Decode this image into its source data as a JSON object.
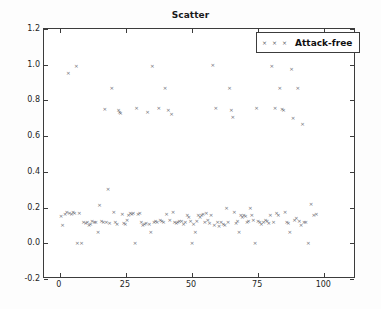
{
  "figure": {
    "title": "Scatter",
    "background_color": "#fdfdfd",
    "axes_color": "#3c3c3c",
    "marker_color": "#5b5b66"
  },
  "legend": {
    "position": "upper right",
    "entries": [
      {
        "label": "Attack-free",
        "marker": "x",
        "marker_count": 3,
        "color": "#5b5b66"
      }
    ],
    "label": "Attack-free"
  },
  "chart_data": {
    "type": "scatter",
    "title": "Scatter",
    "xlabel": "",
    "ylabel": "",
    "xlim": [
      -6,
      112
    ],
    "ylim": [
      -0.2,
      1.2
    ],
    "xticks": [
      0,
      25,
      50,
      75,
      100
    ],
    "yticks": [
      -0.2,
      0.0,
      0.2,
      0.4,
      0.6,
      0.8,
      1.0,
      1.2
    ],
    "xtick_labels": [
      "0",
      "25",
      "50",
      "75",
      "100"
    ],
    "ytick_labels": [
      "-0.2",
      "0.0",
      "0.2",
      "0.4",
      "0.6",
      "0.8",
      "1.0",
      "1.2"
    ],
    "grid": false,
    "legend_position": "upper right",
    "series": [
      {
        "name": "Attack-free",
        "marker": "x",
        "color": "#5b5b66",
        "points": [
          [
            0.5,
            0.15
          ],
          [
            1.0,
            0.1
          ],
          [
            2.0,
            0.16
          ],
          [
            2.6,
            0.17
          ],
          [
            3.2,
            0.95
          ],
          [
            3.6,
            0.165
          ],
          [
            4.4,
            0.16
          ],
          [
            5.0,
            0.17
          ],
          [
            5.6,
            0.165
          ],
          [
            6.2,
            0.99
          ],
          [
            6.6,
            0.0
          ],
          [
            7.4,
            0.165
          ],
          [
            8.2,
            0.0
          ],
          [
            9.0,
            0.115
          ],
          [
            9.8,
            0.11
          ],
          [
            10.4,
            0.115
          ],
          [
            11.0,
            0.1
          ],
          [
            11.6,
            0.105
          ],
          [
            12.2,
            0.12
          ],
          [
            13.0,
            0.115
          ],
          [
            13.6,
            0.115
          ],
          [
            14.4,
            0.06
          ],
          [
            15.0,
            0.21
          ],
          [
            15.8,
            0.12
          ],
          [
            16.4,
            0.115
          ],
          [
            17.0,
            0.75
          ],
          [
            17.6,
            0.115
          ],
          [
            18.2,
            0.3
          ],
          [
            18.8,
            0.11
          ],
          [
            19.6,
            0.865
          ],
          [
            20.4,
            0.17
          ],
          [
            21.0,
            0.115
          ],
          [
            21.6,
            0.105
          ],
          [
            22.2,
            0.745
          ],
          [
            22.6,
            0.735
          ],
          [
            23.0,
            0.725
          ],
          [
            23.6,
            0.16
          ],
          [
            24.2,
            0.11
          ],
          [
            24.8,
            0.105
          ],
          [
            25.4,
            0.13
          ],
          [
            26.0,
            0.155
          ],
          [
            26.6,
            0.165
          ],
          [
            27.2,
            0.16
          ],
          [
            27.8,
            0.165
          ],
          [
            28.4,
            0.0
          ],
          [
            29.0,
            0.755
          ],
          [
            29.6,
            0.16
          ],
          [
            30.2,
            0.165
          ],
          [
            30.8,
            0.115
          ],
          [
            31.4,
            0.1
          ],
          [
            32.0,
            0.105
          ],
          [
            32.6,
            0.11
          ],
          [
            33.2,
            0.73
          ],
          [
            33.8,
            0.105
          ],
          [
            34.4,
            0.06
          ],
          [
            35.0,
            0.99
          ],
          [
            35.6,
            0.115
          ],
          [
            36.2,
            0.12
          ],
          [
            36.8,
            0.115
          ],
          [
            37.4,
            0.755
          ],
          [
            38.0,
            0.125
          ],
          [
            38.6,
            0.12
          ],
          [
            39.2,
            0.115
          ],
          [
            39.8,
            0.865
          ],
          [
            40.4,
            0.16
          ],
          [
            41.0,
            0.745
          ],
          [
            41.6,
            0.125
          ],
          [
            42.2,
            0.72
          ],
          [
            42.8,
            0.17
          ],
          [
            43.4,
            0.115
          ],
          [
            44.0,
            0.11
          ],
          [
            44.6,
            0.115
          ],
          [
            45.2,
            0.12
          ],
          [
            46.0,
            0.12
          ],
          [
            46.8,
            0.105
          ],
          [
            47.4,
            0.115
          ],
          [
            48.2,
            0.155
          ],
          [
            48.8,
            0.145
          ],
          [
            49.4,
            0.12
          ],
          [
            50.0,
            0.0
          ],
          [
            50.6,
            0.105
          ],
          [
            51.2,
            0.06
          ],
          [
            51.8,
            0.12
          ],
          [
            52.4,
            0.155
          ],
          [
            53.0,
            0.145
          ],
          [
            53.6,
            0.155
          ],
          [
            54.2,
            0.16
          ],
          [
            54.8,
            0.115
          ],
          [
            55.4,
            0.165
          ],
          [
            56.0,
            0.125
          ],
          [
            56.6,
            0.11
          ],
          [
            57.2,
            0.155
          ],
          [
            57.8,
            0.995
          ],
          [
            58.4,
            0.1
          ],
          [
            59.0,
            0.755
          ],
          [
            59.6,
            0.115
          ],
          [
            60.2,
            0.095
          ],
          [
            61.0,
            0.115
          ],
          [
            61.8,
            0.105
          ],
          [
            62.4,
            0.1
          ],
          [
            63.0,
            0.195
          ],
          [
            63.6,
            0.115
          ],
          [
            64.2,
            0.865
          ],
          [
            64.8,
            0.745
          ],
          [
            65.4,
            0.705
          ],
          [
            66.0,
            0.175
          ],
          [
            66.6,
            0.11
          ],
          [
            67.2,
            0.12
          ],
          [
            67.8,
            0.06
          ],
          [
            68.4,
            0.155
          ],
          [
            69.0,
            0.145
          ],
          [
            69.6,
            0.155
          ],
          [
            70.2,
            0.15
          ],
          [
            70.8,
            0.115
          ],
          [
            71.4,
            0.12
          ],
          [
            72.0,
            0.195
          ],
          [
            72.6,
            0.155
          ],
          [
            73.2,
            0.125
          ],
          [
            73.8,
            0.0
          ],
          [
            74.4,
            0.755
          ],
          [
            75.0,
            0.12
          ],
          [
            75.6,
            0.115
          ],
          [
            76.2,
            0.105
          ],
          [
            77.0,
            0.115
          ],
          [
            77.8,
            0.13
          ],
          [
            78.4,
            0.12
          ],
          [
            79.0,
            0.11
          ],
          [
            79.6,
            0.155
          ],
          [
            80.2,
            0.99
          ],
          [
            80.8,
            0.115
          ],
          [
            81.4,
            0.755
          ],
          [
            82.0,
            0.165
          ],
          [
            82.6,
            0.155
          ],
          [
            83.2,
            0.865
          ],
          [
            84.0,
            0.75
          ],
          [
            84.6,
            0.745
          ],
          [
            85.2,
            0.17
          ],
          [
            85.8,
            0.115
          ],
          [
            86.4,
            0.11
          ],
          [
            87.0,
            0.06
          ],
          [
            87.6,
            0.975
          ],
          [
            88.2,
            0.7
          ],
          [
            88.8,
            0.125
          ],
          [
            89.4,
            0.14
          ],
          [
            90.0,
            0.865
          ],
          [
            90.6,
            0.12
          ],
          [
            91.2,
            0.1
          ],
          [
            91.8,
            0.665
          ],
          [
            92.4,
            0.115
          ],
          [
            93.0,
            0.115
          ],
          [
            94.0,
            0.0
          ],
          [
            95.0,
            0.22
          ],
          [
            96.0,
            0.155
          ],
          [
            97.0,
            0.16
          ]
        ]
      }
    ]
  }
}
